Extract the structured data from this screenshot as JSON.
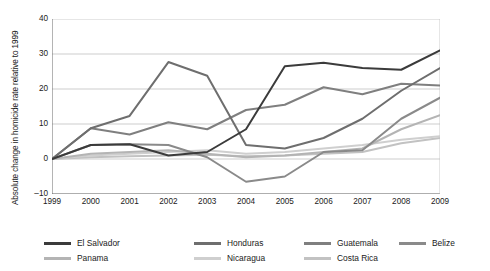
{
  "chart_data": {
    "type": "line",
    "title": "",
    "xlabel": "",
    "ylabel": "Absolute change in homicide rate relative to 1999",
    "x": [
      1999,
      2000,
      2001,
      2002,
      2003,
      2004,
      2005,
      2006,
      2007,
      2008,
      2009
    ],
    "xlim": [
      1999,
      2009
    ],
    "ylim": [
      -10,
      40
    ],
    "yticks": [
      -10,
      0,
      10,
      20,
      30,
      40
    ],
    "xticks": [
      "1999",
      "2000",
      "2001",
      "2002",
      "2003",
      "2004",
      "2005",
      "2006",
      "2007",
      "2008",
      "2009"
    ],
    "grid": "horizontal",
    "legend_position": "bottom",
    "series": [
      {
        "name": "El Salvador",
        "color": "#3b3b3b",
        "values": [
          0,
          4.0,
          4.2,
          1.0,
          2.0,
          8.5,
          26.5,
          27.5,
          26.0,
          25.5,
          31.0
        ]
      },
      {
        "name": "Honduras",
        "color": "#6e6e6e",
        "values": [
          0,
          8.8,
          12.3,
          27.7,
          23.8,
          4.0,
          3.0,
          6.0,
          11.5,
          19.5,
          26.0
        ]
      },
      {
        "name": "Guatemala",
        "color": "#7f7f7f",
        "values": [
          0,
          8.8,
          7.0,
          10.5,
          8.5,
          14.0,
          15.5,
          20.5,
          18.5,
          21.5,
          21.0
        ]
      },
      {
        "name": "Belize",
        "color": "#8a8a8a",
        "values": [
          0,
          4.0,
          4.2,
          4.0,
          0.5,
          -6.5,
          -5.0,
          2.0,
          2.5,
          11.5,
          17.5
        ]
      },
      {
        "name": "Panama",
        "color": "#b4b4b4",
        "values": [
          0,
          1.5,
          2.0,
          2.5,
          1.5,
          0.5,
          1.0,
          2.0,
          3.0,
          8.5,
          12.5
        ]
      },
      {
        "name": "Nicaragua",
        "color": "#cfcfcf",
        "values": [
          0,
          1.0,
          1.5,
          2.0,
          2.5,
          1.5,
          2.0,
          3.0,
          4.0,
          5.5,
          6.5
        ]
      },
      {
        "name": "Costa Rica",
        "color": "#c2c2c2",
        "values": [
          0,
          0.5,
          0.8,
          1.0,
          1.2,
          0.8,
          1.0,
          1.5,
          2.0,
          4.5,
          6.0
        ]
      }
    ]
  },
  "legend": {
    "rows": [
      [
        {
          "label": "El Salvador",
          "color": "#3b3b3b",
          "x": 0
        },
        {
          "label": "Honduras",
          "color": "#6e6e6e",
          "x": 150
        },
        {
          "label": "Guatemala",
          "color": "#7f7f7f",
          "x": 260
        },
        {
          "label": "Belize",
          "color": "#8a8a8a",
          "x": 355
        }
      ],
      [
        {
          "label": "Panama",
          "color": "#b4b4b4",
          "x": 0
        },
        {
          "label": "Nicaragua",
          "color": "#cfcfcf",
          "x": 150
        },
        {
          "label": "Costa Rica",
          "color": "#c2c2c2",
          "x": 260
        }
      ]
    ]
  },
  "axis": {
    "y_title": "Absolute change in homicide rate relative to 1999",
    "grid_color": "#b7b7b7",
    "axis_color": "#6a6a6a",
    "text_color": "#1a1a1a"
  }
}
